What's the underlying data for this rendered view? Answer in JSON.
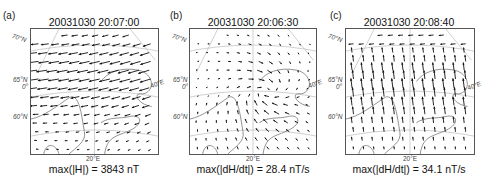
{
  "figure": {
    "panels": [
      {
        "label": "(a)",
        "title": "20031030 20:07:00",
        "footer": "max(|H|) = 3843 nT",
        "lat_labels": [
          "70°N",
          "65°N",
          "0°",
          "60°N"
        ],
        "lon_labels": [
          "20°E",
          "40°E"
        ]
      },
      {
        "label": "(b)",
        "title": "20031030 20:06:30",
        "footer": "max(|dH/dt|) = 28.4 nT/s",
        "lat_labels": [
          "70°N",
          "65°N",
          "0°",
          "60°N"
        ],
        "lon_labels": [
          "20°E",
          "40°E"
        ]
      },
      {
        "label": "(c)",
        "title": "20031030 20:08:40",
        "footer": "max(|dH/dt|) = 34.1 nT/s",
        "lat_labels": [
          "70°N",
          "65°N",
          "0°",
          "60°N"
        ],
        "lon_labels": [
          "20°E",
          "40°E"
        ]
      }
    ],
    "left_edge_label": "E"
  },
  "chart_data": [
    {
      "type": "quiver",
      "panel": "(a)",
      "title": "20031030 20:07:00",
      "quantity": "H (horizontal geomagnetic field disturbance)",
      "max_magnitude": 3843,
      "units": "nT",
      "dominant_direction": "westward (arrows pointing left/west-southwest), strongest in northern-central region",
      "lat_ticks": [
        "60°N",
        "65°N",
        "70°N"
      ],
      "lon_ticks": [
        "0°",
        "20°E",
        "40°E"
      ],
      "grid": true
    },
    {
      "type": "quiver",
      "panel": "(b)",
      "title": "20031030 20:06:30",
      "quantity": "dH/dt",
      "max_magnitude": 28.4,
      "units": "nT/s",
      "dominant_direction": "convergent/rotational pattern centered near 65°N, 20-25°E; westward in north, northward in south",
      "lat_ticks": [
        "60°N",
        "65°N",
        "70°N"
      ],
      "lon_ticks": [
        "0°",
        "20°E",
        "40°E"
      ],
      "grid": true
    },
    {
      "type": "quiver",
      "panel": "(c)",
      "title": "20031030 20:08:40",
      "quantity": "dH/dt",
      "max_magnitude": 34.1,
      "units": "nT/s",
      "dominant_direction": "northward (arrows pointing up/north-northwest) across most of the domain; westward in far north",
      "lat_ticks": [
        "60°N",
        "65°N",
        "70°N"
      ],
      "lon_ticks": [
        "0°",
        "20°E",
        "40°E"
      ],
      "grid": true
    }
  ]
}
